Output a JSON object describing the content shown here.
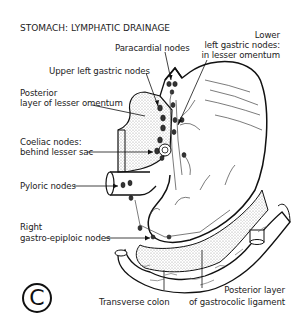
{
  "title": "STOMACH: LYMPHATIC DRAINAGE",
  "labels": {
    "lower_left_gastric_1": "Lower",
    "lower_left_gastric_2": "left gastric nodes:",
    "lower_left_gastric_3": "in lesser omentum",
    "paracardial": "Paracardial nodes",
    "upper_left_gastric": "Upper left gastric nodes",
    "posterior_lesser_1": "Posterior",
    "posterior_lesser_2": "layer of lesser omentum",
    "coeliac_1": "Coeliac nodes:",
    "coeliac_2": "behind lesser sac",
    "pyloric": "Pyloric nodes",
    "right_ge_1": "Right",
    "right_ge_2": "gastro-epiploic nodes",
    "transverse_colon": "Transverse colon",
    "posterior_gastrocolic_1": "Posterior layer",
    "posterior_gastrocolic_2": "of gastrocolic ligament"
  },
  "panel_letter": "C",
  "colors": {
    "ink": "#111111",
    "stipple": "#cfcfcf",
    "background": "#ffffff"
  }
}
